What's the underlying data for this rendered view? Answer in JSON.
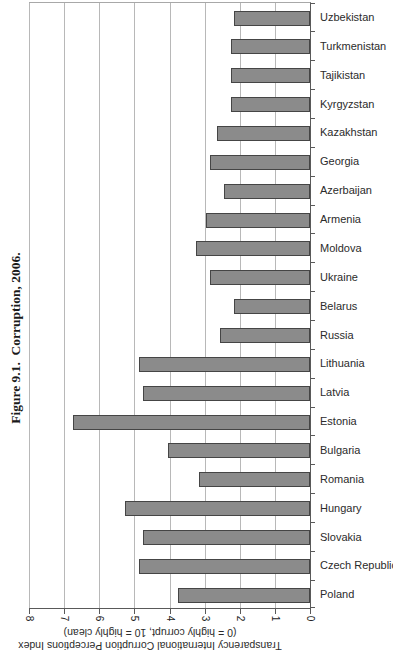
{
  "figure": {
    "caption": "Figure 9.1.  Corruption, 2006."
  },
  "chart_data": {
    "type": "bar",
    "title": "Figure 9.1.  Corruption, 2006.",
    "orientation": "landscape chart rotated 90° clockwise on portrait page; value 0 at right, 8 at left; bars extend leftward from the category axis on the right",
    "categories": [
      "Uzbekistan",
      "Turkmenistan",
      "Tajikistan",
      "Kyrgyzstan",
      "Kazakhstan",
      "Georgia",
      "Azerbaijan",
      "Armenia",
      "Moldova",
      "Ukraine",
      "Belarus",
      "Russia",
      "Lithuania",
      "Latvia",
      "Estonia",
      "Bulgaria",
      "Romania",
      "Hungary",
      "Slovakia",
      "Czech Republic",
      "Poland"
    ],
    "values": [
      2.1,
      2.2,
      2.2,
      2.2,
      2.6,
      2.8,
      2.4,
      2.9,
      3.2,
      2.8,
      2.1,
      2.5,
      4.8,
      4.7,
      6.7,
      4.0,
      3.1,
      5.2,
      4.7,
      4.8,
      3.7
    ],
    "value_axis": {
      "min": 0,
      "max": 8,
      "ticks": [
        8,
        7,
        6,
        5,
        4,
        3,
        2,
        1,
        0
      ],
      "title_line1": "Transparency International Corruption Perceptions Index",
      "title_line2": "(0 = highly corrupt, 10 = highly clean)"
    },
    "gridlines": true,
    "legend": "none",
    "colors": {
      "bar_fill": "#8b8b8b",
      "bar_border": "#454545",
      "gridline": "#b8b8b8",
      "axis_line": "#595959",
      "text": "#2b2b2b"
    }
  }
}
